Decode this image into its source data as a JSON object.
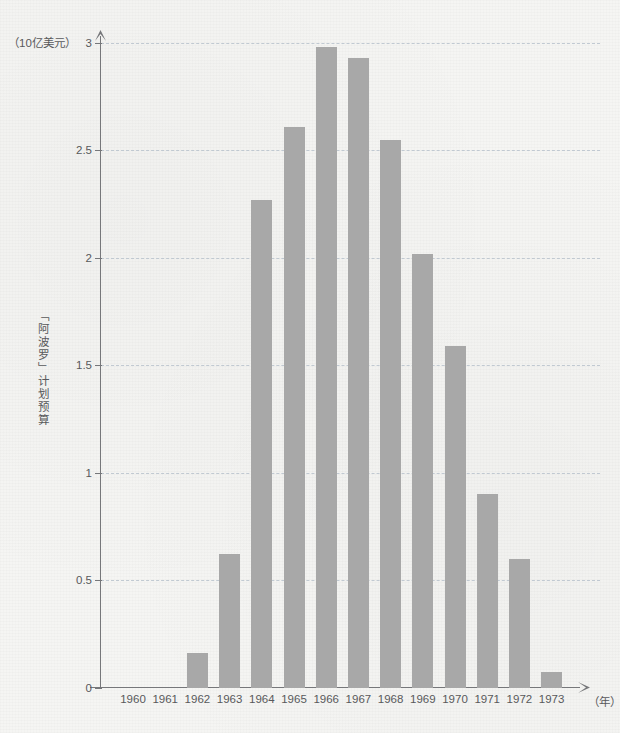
{
  "chart_data": {
    "type": "bar",
    "title": "",
    "categories": [
      "1960",
      "1961",
      "1962",
      "1963",
      "1964",
      "1965",
      "1966",
      "1967",
      "1968",
      "1969",
      "1970",
      "1971",
      "1972",
      "1973"
    ],
    "values": [
      0,
      0,
      0.16,
      0.62,
      2.27,
      2.61,
      2.98,
      2.93,
      2.55,
      2.02,
      1.59,
      0.9,
      0.6,
      0.07
    ],
    "xlabel": "（年）",
    "ylabel": "「阿波罗」计划预算",
    "y_unit_label": "（10亿美元）",
    "ylim": [
      0,
      3
    ],
    "yticks": [
      "0",
      "0.5",
      "1",
      "1.5",
      "2",
      "2.5",
      "3"
    ],
    "ytick_values": [
      0,
      0.5,
      1,
      1.5,
      2,
      2.5,
      3
    ],
    "grid": true,
    "legend": "none",
    "bar_color": "#a8a8a8",
    "gridline_color": "#b9c3cd",
    "axis_color": "#76777a",
    "background_color": "#f5f5f3"
  }
}
